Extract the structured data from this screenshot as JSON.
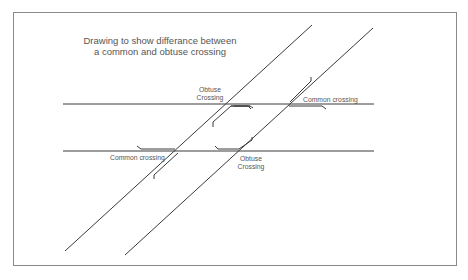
{
  "diagram": {
    "title_line1": "Drawing to show differance between",
    "title_line2": "a common and obtuse crossing",
    "labels": {
      "obtuse_top_line1": "Obtuse",
      "obtuse_top_line2": "Crossing",
      "common_right": "Common crossing",
      "common_left": "Common crossing",
      "obtuse_bottom_line1": "Obtuse",
      "obtuse_bottom_line2": "Crossing"
    },
    "colors": {
      "line": "#3a3a3a",
      "frame": "#8a8a8a",
      "text": "#555555"
    }
  }
}
